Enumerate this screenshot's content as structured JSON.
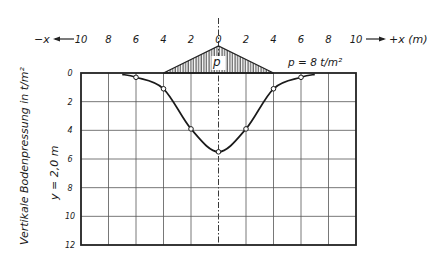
{
  "chart_data": {
    "type": "line",
    "title": "",
    "xlabel": "x (m)",
    "x_axis_left_label": "-x",
    "x_axis_right_label": "+x (m)",
    "ylabel": "Vertikale Bodenpressung in t/m²",
    "ylabel_secondary": "y = 2,0 m",
    "x_ticks": [
      "10",
      "8",
      "6",
      "4",
      "2",
      "0",
      "2",
      "4",
      "6",
      "8",
      "10"
    ],
    "y_ticks": [
      "0",
      "2",
      "4",
      "6",
      "8",
      "10",
      "12"
    ],
    "xlim": [
      -10,
      10
    ],
    "ylim": [
      0,
      12
    ],
    "y_inverted": true,
    "grid": true,
    "load": {
      "shape": "triangle",
      "label": "p",
      "annotation": "p = 8 t/m²",
      "x_start": -4,
      "x_peak": 0,
      "x_end": 4
    },
    "series": [
      {
        "name": "Vertikale Bodenpressung",
        "x": [
          -6,
          -4,
          -2,
          0,
          2,
          4,
          6
        ],
        "y": [
          0.3,
          1.1,
          3.9,
          5.5,
          3.9,
          1.1,
          0.3
        ]
      }
    ]
  },
  "labels": {
    "minus_x": "−x",
    "plus_x": "+x (m)",
    "load_p": "p",
    "load_value": "p = 8 t/m²",
    "y_title": "Vertikale Bodenpressung in t/m²",
    "y_depth": "y = 2,0 m"
  }
}
